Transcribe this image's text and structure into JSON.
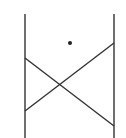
{
  "diagram": {
    "stroke_color": "#333333",
    "background": "#ffffff",
    "vertical_lines": [
      {
        "x": 25,
        "y1": 14,
        "y2": 138
      },
      {
        "x": 114,
        "y1": 14,
        "y2": 138
      }
    ],
    "diagonals": [
      {
        "x1": 25,
        "y1": 58,
        "x2": 114,
        "y2": 126
      },
      {
        "x1": 25,
        "y1": 111,
        "x2": 114,
        "y2": 43
      }
    ],
    "dot": {
      "cx": 70,
      "cy": 43,
      "r": 2
    }
  }
}
